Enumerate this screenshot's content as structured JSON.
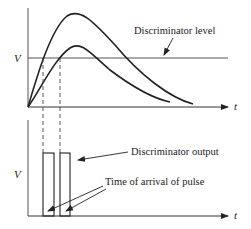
{
  "top_plot": {
    "y_label": "V",
    "x_label": "t",
    "annotation": "Discriminator level"
  },
  "bottom_plot": {
    "y_label": "V",
    "x_label": "t",
    "annotation_output": "Discriminator output",
    "annotation_arrival": "Time of arrival of pulse"
  },
  "colors": {
    "line": "#222222",
    "level": "#555555"
  }
}
